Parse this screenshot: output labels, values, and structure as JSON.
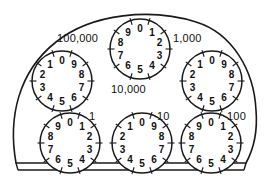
{
  "device": {
    "name": "utility-meter-dial-face",
    "title": "Six-dial utility meter register",
    "body_fill": "#ffffff",
    "line_color": "#1a1a1a",
    "text_color": "#111111"
  },
  "dials": [
    {
      "id": "dial-100000",
      "label": "100,000",
      "label_x": 57,
      "label_y": 33,
      "cx": 62,
      "cy": 81,
      "r": 30,
      "direction": "counter-clockwise",
      "digits": [
        "0",
        "1",
        "2",
        "3",
        "4",
        "5",
        "6",
        "7",
        "8",
        "9"
      ]
    },
    {
      "id": "dial-10000",
      "label": "10,000",
      "label_x": 111,
      "label_y": 84,
      "cx": 140,
      "cy": 49,
      "r": 30,
      "direction": "clockwise",
      "digits": [
        "0",
        "1",
        "2",
        "3",
        "4",
        "5",
        "6",
        "7",
        "8",
        "9"
      ]
    },
    {
      "id": "dial-1000",
      "label": "1,000",
      "label_x": 173,
      "label_y": 33,
      "cx": 212,
      "cy": 81,
      "r": 30,
      "direction": "counter-clockwise",
      "digits": [
        "0",
        "1",
        "2",
        "3",
        "4",
        "5",
        "6",
        "7",
        "8",
        "9"
      ]
    },
    {
      "id": "dial-1",
      "label": "1",
      "label_x": 89,
      "label_y": 111,
      "cx": 70,
      "cy": 143,
      "r": 30,
      "direction": "clockwise",
      "digits": [
        "0",
        "1",
        "2",
        "3",
        "4",
        "5",
        "6",
        "7",
        "8",
        "9"
      ]
    },
    {
      "id": "dial-10",
      "label": "10",
      "label_x": 157,
      "label_y": 111,
      "cx": 142,
      "cy": 143,
      "r": 30,
      "direction": "counter-clockwise",
      "digits": [
        "0",
        "1",
        "2",
        "3",
        "4",
        "5",
        "6",
        "7",
        "8",
        "9"
      ]
    },
    {
      "id": "dial-100",
      "label": "100",
      "label_x": 227,
      "label_y": 111,
      "cx": 211,
      "cy": 143,
      "r": 30,
      "direction": "clockwise",
      "digits": [
        "0",
        "1",
        "2",
        "3",
        "4",
        "5",
        "6",
        "7",
        "8",
        "9"
      ]
    }
  ]
}
